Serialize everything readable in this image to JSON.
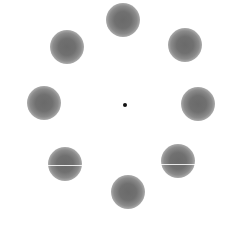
{
  "stimulus": {
    "background_color": "#ffffff",
    "blob_color": "#6e6e6e",
    "fixation_color": "#111111",
    "blobs": [
      {
        "position": "top",
        "x": 123,
        "y": 20
      },
      {
        "position": "top-right",
        "x": 185,
        "y": 45
      },
      {
        "position": "right",
        "x": 198,
        "y": 104
      },
      {
        "position": "bottom-right",
        "x": 178,
        "y": 161
      },
      {
        "position": "bottom",
        "x": 128,
        "y": 192
      },
      {
        "position": "bottom-left",
        "x": 65,
        "y": 164
      },
      {
        "position": "left",
        "x": 44,
        "y": 103
      },
      {
        "position": "top-left",
        "x": 67,
        "y": 47
      }
    ],
    "fixation": {
      "x": 125,
      "y": 105
    }
  }
}
